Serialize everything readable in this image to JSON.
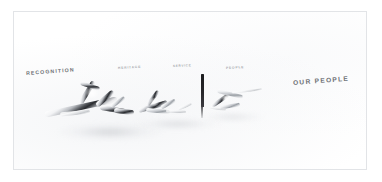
{
  "slide": {
    "background_color": "#ffffff",
    "frame_color": "#e2e4e7"
  },
  "labels": {
    "recognition": "RECOGNITION",
    "heritage": "HERITAGE",
    "service": "SERVICE",
    "people_small": "PEOPLE",
    "our_people": "OUR PEOPLE"
  },
  "artwork": {
    "description": "glossy chrome script lettering with soft reflections",
    "chrome_highlight": "#ffffff",
    "chrome_shadow": "#2a2c30",
    "reflection_color": "#babdc2",
    "center_bar_color": "#1c1c1e"
  }
}
